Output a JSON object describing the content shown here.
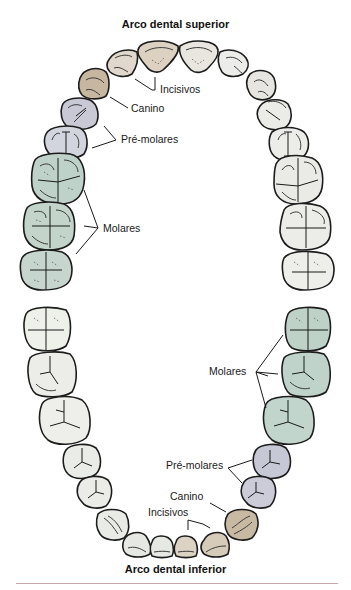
{
  "upper_arch": {
    "title": "Arco dental superior",
    "labels": {
      "incisors": "Incisivos",
      "canine": "Canino",
      "premolars": "Pré-molares",
      "molars": "Molares"
    }
  },
  "lower_arch": {
    "title": "Arco dental inferior",
    "labels": {
      "incisors": "Incisivos",
      "canine": "Canino",
      "premolars": "Pré-molares",
      "molars": "Molares"
    }
  },
  "colors": {
    "incisor_tint": "#d9cdbb",
    "canine_tint": "#c9b9a2",
    "premolar_tint": "#c9cad6",
    "molar_tint": "#bccfc6",
    "neutral_tooth": "#eceee8",
    "outline": "#1c1c1c",
    "rule": "#c9a8ac"
  }
}
